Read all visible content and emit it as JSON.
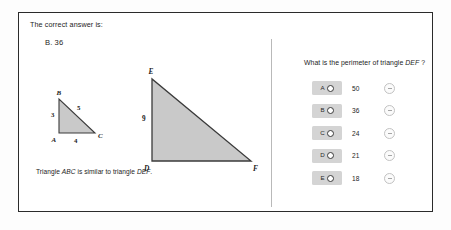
{
  "header": {
    "prompt": "The correct answer is:",
    "correct_answer": "B. 36"
  },
  "figures": {
    "small_triangle": {
      "name": "triangle-abc",
      "vertices": [
        "B",
        "A",
        "C"
      ],
      "side_labels": [
        "3",
        "5",
        "4"
      ],
      "label_left": "3",
      "label_hypotenuse": "5",
      "label_bottom": "4",
      "vertex_top": "B",
      "vertex_bottom_left": "A",
      "vertex_bottom_right": "C",
      "fill_color": "#c9c9c9",
      "stroke_color": "#3b3b3b"
    },
    "large_triangle": {
      "name": "triangle-def",
      "vertices": [
        "E",
        "D",
        "F"
      ],
      "label_left": "9",
      "vertex_top": "E",
      "vertex_bottom_left": "D",
      "vertex_bottom_right": "F",
      "fill_color": "#c9c9c9",
      "stroke_color": "#3b3b3b"
    },
    "caption_prefix": "Triangle ",
    "caption_abc": "ABC",
    "caption_middle": " is similar to triangle ",
    "caption_def": "DEF",
    "caption_suffix": "."
  },
  "question": {
    "text_prefix": "What is the perimeter of triangle ",
    "subject": "DEF",
    "text_suffix": " ?"
  },
  "choices": [
    {
      "letter": "A",
      "value": "50",
      "eliminate_icon": "minus-circle-icon",
      "selected": false
    },
    {
      "letter": "B",
      "value": "36",
      "eliminate_icon": "minus-circle-icon",
      "selected": false
    },
    {
      "letter": "C",
      "value": "24",
      "eliminate_icon": "minus-circle-icon",
      "selected": false
    },
    {
      "letter": "D",
      "value": "21",
      "eliminate_icon": "minus-circle-icon",
      "selected": false
    },
    {
      "letter": "E",
      "value": "18",
      "eliminate_icon": "minus-circle-icon",
      "selected": false
    }
  ],
  "colors": {
    "card_border": "#2b2b2b",
    "choice_key_bg": "#d4d4d4",
    "divider": "#b9b9b9",
    "shape_fill": "#c9c9c9",
    "shape_stroke": "#3b3b3b"
  }
}
